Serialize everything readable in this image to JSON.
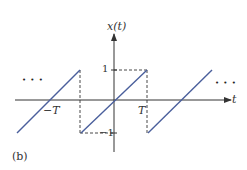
{
  "figure": {
    "label": "(b)",
    "y_axis_label": "x(t)",
    "x_axis_label": "t",
    "tick_labels": {
      "y_pos": "1",
      "y_neg": "−1",
      "x_pos": "T",
      "x_neg": "−T"
    },
    "ellipsis_left": "• • •",
    "ellipsis_right": "• • •",
    "colors": {
      "signal": "#4a5f9c",
      "axis": "#333333",
      "dashed": "#333333",
      "text": "#333333"
    },
    "signal_description": "Periodic sawtooth wave x(t) = t/T over each period, ranging from -1 to 1, with period 2T",
    "segments": [
      {
        "from": [
          -1.97,
          -1
        ],
        "to": [
          -1,
          1
        ]
      },
      {
        "from": [
          -1,
          -1
        ],
        "to": [
          1,
          1
        ]
      },
      {
        "from": [
          1,
          -1
        ],
        "to": [
          1.97,
          1
        ]
      }
    ]
  }
}
